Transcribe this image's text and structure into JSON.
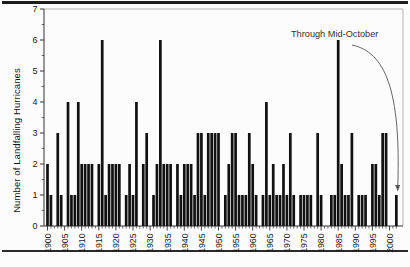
{
  "chart_data": {
    "type": "bar",
    "title": "",
    "ylabel": "Number of Landfalling Hurricanes",
    "xlabel": "",
    "annotation": "Through Mid-October",
    "ylim": [
      0,
      7
    ],
    "yticks": [
      0,
      1,
      2,
      3,
      4,
      5,
      6,
      7
    ],
    "xtick_labels": [
      "1900",
      "1905",
      "1910",
      "1915",
      "1920",
      "1925",
      "1930",
      "1935",
      "1940",
      "1945",
      "1950",
      "1955",
      "1960",
      "1965",
      "1970",
      "1975",
      "1980",
      "1985",
      "1990",
      "1995",
      "2000"
    ],
    "year_start": 1900,
    "year_end": 2002,
    "values": [
      2,
      1,
      0,
      3,
      1,
      0,
      4,
      1,
      1,
      4,
      2,
      2,
      2,
      2,
      0,
      2,
      6,
      1,
      2,
      2,
      2,
      2,
      0,
      1,
      2,
      1,
      4,
      0,
      2,
      3,
      0,
      1,
      2,
      6,
      2,
      2,
      2,
      0,
      2,
      1,
      2,
      2,
      2,
      1,
      3,
      3,
      1,
      3,
      3,
      3,
      3,
      0,
      1,
      2,
      3,
      3,
      1,
      1,
      1,
      3,
      2,
      1,
      0,
      1,
      4,
      1,
      2,
      1,
      1,
      2,
      1,
      3,
      1,
      0,
      1,
      1,
      1,
      1,
      0,
      3,
      1,
      0,
      0,
      1,
      1,
      6,
      2,
      1,
      1,
      3,
      0,
      1,
      1,
      1,
      0,
      2,
      2,
      1,
      3,
      3,
      0,
      0,
      1
    ],
    "bar_color": "#111111",
    "axis_color": "#333333",
    "frame_color": "#b3b3b3",
    "grid": false,
    "legend": "none",
    "annotation_points_to_year": 2002
  }
}
